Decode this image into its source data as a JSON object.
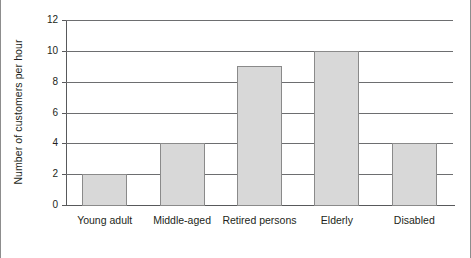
{
  "chart_data": {
    "type": "bar",
    "title": "",
    "xlabel": "",
    "ylabel": "Number of customers per hour",
    "categories": [
      "Young adult",
      "Middle-aged",
      "Retired persons",
      "Elderly",
      "Disabled"
    ],
    "values": [
      2,
      4,
      9,
      10,
      4
    ],
    "ylim": [
      0,
      12
    ],
    "ytick_values": [
      0,
      2,
      4,
      6,
      8,
      10,
      12
    ],
    "ytick_labels": [
      "0",
      "2",
      "4",
      "6",
      "8",
      "10",
      "12"
    ],
    "grid": "horizontal",
    "legend": "none",
    "bar_fill_color": "#d8d8d8",
    "bar_border_color": "#8a8a8a",
    "axis_color": "#58595b",
    "gridline_color": "#6d6e70",
    "text_color": "#231f20",
    "background_color": "#ffffff"
  }
}
